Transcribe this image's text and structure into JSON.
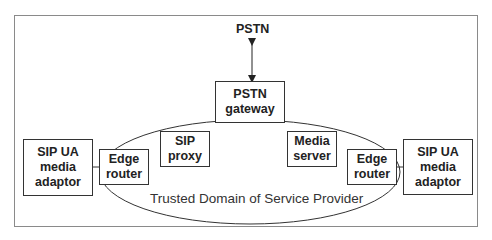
{
  "diagram": {
    "title": "",
    "nodes": {
      "pstn": {
        "label": "PSTN"
      },
      "pstn_gateway": {
        "label": "PSTN\ngateway"
      },
      "sip_proxy": {
        "label": "SIP\nproxy"
      },
      "media_server": {
        "label": "Media\nserver"
      },
      "edge_router_left": {
        "label": "Edge\nrouter"
      },
      "edge_router_right": {
        "label": "Edge\nrouter"
      },
      "sip_ua_left": {
        "label": "SIP UA\nmedia\nadaptor"
      },
      "sip_ua_right": {
        "label": "SIP UA\nmedia\nadaptor"
      }
    },
    "domain_label": "Trusted Domain of Service Provider",
    "edges": [
      {
        "from": "pstn",
        "to": "pstn_gateway",
        "type": "bidirectional-arrow"
      },
      {
        "from": "sip_ua_left",
        "to": "edge_router_left",
        "type": "line"
      },
      {
        "from": "edge_router_right",
        "to": "sip_ua_right",
        "type": "line"
      }
    ],
    "colors": {
      "stroke": "#333333",
      "frame": "#8a8a8a",
      "text": "#222222"
    }
  }
}
